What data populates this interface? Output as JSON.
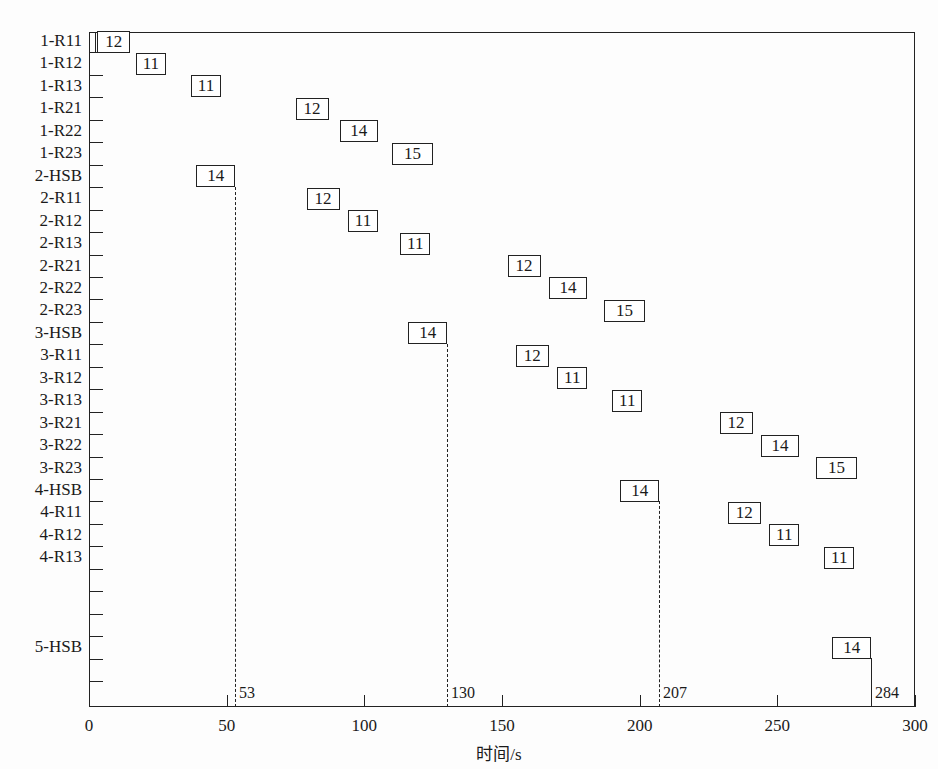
{
  "chart_data": {
    "type": "gantt",
    "title": "",
    "xlabel": "时间/s",
    "ylabel": "",
    "xlim": [
      0,
      300
    ],
    "x_ticks": [
      0,
      50,
      100,
      150,
      200,
      250,
      300
    ],
    "grid": false,
    "legend": null,
    "rows": [
      "1-R11",
      "1-R12",
      "1-R13",
      "1-R21",
      "1-R22",
      "1-R23",
      "2-HSB",
      "2-R11",
      "2-R12",
      "2-R13",
      "2-R21",
      "2-R22",
      "2-R23",
      "3-HSB",
      "3-R11",
      "3-R12",
      "3-R13",
      "3-R21",
      "3-R22",
      "3-R23",
      "4-HSB",
      "4-R11",
      "4-R12",
      "4-R13",
      "",
      "",
      "",
      "5-HSB",
      "",
      ""
    ],
    "tasks": [
      {
        "row": "1-R11",
        "start": 3,
        "duration": 12,
        "label": "12"
      },
      {
        "row": "1-R12",
        "start": 17,
        "duration": 11,
        "label": "11"
      },
      {
        "row": "1-R13",
        "start": 37,
        "duration": 11,
        "label": "11"
      },
      {
        "row": "1-R21",
        "start": 75,
        "duration": 12,
        "label": "12"
      },
      {
        "row": "1-R22",
        "start": 91,
        "duration": 14,
        "label": "14"
      },
      {
        "row": "1-R23",
        "start": 110,
        "duration": 15,
        "label": "15"
      },
      {
        "row": "2-HSB",
        "start": 39,
        "duration": 14,
        "label": "14"
      },
      {
        "row": "2-R11",
        "start": 79,
        "duration": 12,
        "label": "12"
      },
      {
        "row": "2-R12",
        "start": 94,
        "duration": 11,
        "label": "11"
      },
      {
        "row": "2-R13",
        "start": 113,
        "duration": 11,
        "label": "11"
      },
      {
        "row": "2-R21",
        "start": 152,
        "duration": 12,
        "label": "12"
      },
      {
        "row": "2-R22",
        "start": 167,
        "duration": 14,
        "label": "14"
      },
      {
        "row": "2-R23",
        "start": 187,
        "duration": 15,
        "label": "15"
      },
      {
        "row": "3-HSB",
        "start": 116,
        "duration": 14,
        "label": "14"
      },
      {
        "row": "3-R11",
        "start": 155,
        "duration": 12,
        "label": "12"
      },
      {
        "row": "3-R12",
        "start": 170,
        "duration": 11,
        "label": "11"
      },
      {
        "row": "3-R13",
        "start": 190,
        "duration": 11,
        "label": "11"
      },
      {
        "row": "3-R21",
        "start": 229,
        "duration": 12,
        "label": "12"
      },
      {
        "row": "3-R22",
        "start": 244,
        "duration": 14,
        "label": "14"
      },
      {
        "row": "3-R23",
        "start": 264,
        "duration": 15,
        "label": "15"
      },
      {
        "row": "4-HSB",
        "start": 193,
        "duration": 14,
        "label": "14"
      },
      {
        "row": "4-R11",
        "start": 232,
        "duration": 12,
        "label": "12"
      },
      {
        "row": "4-R12",
        "start": 247,
        "duration": 11,
        "label": "11"
      },
      {
        "row": "4-R13",
        "start": 267,
        "duration": 11,
        "label": "11"
      },
      {
        "row": "5-HSB",
        "start": 270,
        "duration": 14,
        "label": "14"
      }
    ],
    "milestones": [
      {
        "x": 53,
        "label": "53",
        "from_row": "2-HSB"
      },
      {
        "x": 130,
        "label": "130",
        "from_row": "3-HSB"
      },
      {
        "x": 207,
        "label": "207",
        "from_row": "4-HSB"
      },
      {
        "x": 284,
        "label": "284",
        "from_row": "5-HSB"
      }
    ]
  }
}
